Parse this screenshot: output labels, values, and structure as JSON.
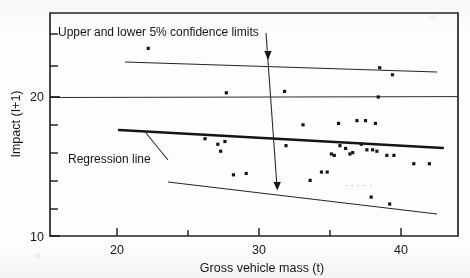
{
  "figure": {
    "background_color": "#fdfdfc",
    "ink_color": "#161616"
  },
  "chart_data": {
    "type": "scatter",
    "title": "",
    "xlabel": "Gross vehicle mass (t)",
    "ylabel": "Impact (I+1)",
    "xlim": [
      15.5,
      45.5
    ],
    "ylim": [
      10,
      25.2
    ],
    "xticks": [
      20,
      25,
      30,
      35,
      40,
      45
    ],
    "xtick_labels": [
      "20",
      "",
      "30",
      "",
      "40",
      ""
    ],
    "xtick_major": [
      20,
      30,
      40
    ],
    "yticks": [
      10,
      11.9,
      13.8,
      15.7,
      17.6,
      20,
      21.5,
      23.4
    ],
    "ytick_labels": [
      "10",
      "",
      "",
      "",
      "",
      "20",
      "",
      ""
    ],
    "ytick_major": [
      10,
      20
    ],
    "grid": false,
    "gridlines_horizontal": [
      20
    ],
    "legend": "none",
    "x": [
      22.2,
      27.7,
      31.8,
      38.5,
      39.4,
      38.4,
      33.1,
      35.6,
      36.9,
      37.5,
      38.2,
      26.2,
      27.1,
      27.6,
      27.3,
      31.9,
      35.7,
      36.1,
      37.2,
      37.6,
      38.0,
      38.3,
      39.0,
      39.5,
      42.0,
      28.2,
      29.1,
      33.6,
      34.4,
      34.8,
      35.1,
      35.3,
      36.4,
      36.6,
      37.9,
      39.2,
      40.9
    ],
    "y": [
      23.5,
      20.3,
      20.4,
      22.1,
      21.6,
      20.0,
      18.0,
      18.1,
      18.3,
      18.3,
      18.1,
      17.0,
      16.6,
      16.8,
      16.1,
      16.5,
      16.5,
      16.3,
      16.6,
      16.2,
      16.2,
      16.1,
      15.8,
      15.8,
      15.2,
      14.4,
      14.5,
      14.0,
      14.6,
      14.6,
      15.9,
      15.8,
      15.9,
      16.0,
      12.8,
      12.3,
      15.2
    ],
    "series": [
      {
        "name": "observations",
        "marker": "square",
        "color": "#161616",
        "points": [
          [
            22.2,
            23.5
          ],
          [
            27.7,
            20.3
          ],
          [
            31.8,
            20.4
          ],
          [
            38.5,
            22.1
          ],
          [
            39.4,
            21.6
          ],
          [
            38.4,
            20.0
          ],
          [
            33.1,
            18.0
          ],
          [
            35.6,
            18.1
          ],
          [
            36.9,
            18.3
          ],
          [
            37.5,
            18.3
          ],
          [
            38.2,
            18.1
          ],
          [
            26.2,
            17.0
          ],
          [
            27.1,
            16.6
          ],
          [
            27.6,
            16.8
          ],
          [
            27.3,
            16.1
          ],
          [
            31.9,
            16.5
          ],
          [
            35.7,
            16.5
          ],
          [
            36.1,
            16.3
          ],
          [
            37.2,
            16.6
          ],
          [
            37.6,
            16.2
          ],
          [
            38.0,
            16.2
          ],
          [
            38.3,
            16.1
          ],
          [
            39.0,
            15.8
          ],
          [
            39.5,
            15.8
          ],
          [
            42.0,
            15.2
          ],
          [
            28.2,
            14.4
          ],
          [
            29.1,
            14.5
          ],
          [
            33.6,
            14.0
          ],
          [
            34.4,
            14.6
          ],
          [
            34.8,
            14.6
          ],
          [
            35.1,
            15.9
          ],
          [
            35.3,
            15.8
          ],
          [
            36.4,
            15.9
          ],
          [
            36.6,
            16.0
          ],
          [
            37.9,
            12.8
          ],
          [
            39.2,
            12.3
          ],
          [
            40.9,
            15.2
          ]
        ]
      }
    ],
    "lines": [
      {
        "name": "regression-line",
        "label": "Regression line",
        "style": "solid-bold",
        "width": 2.2,
        "points": [
          [
            20.8,
            17.7
          ],
          [
            43.5,
            16.4
          ]
        ]
      },
      {
        "name": "upper-confidence-limit",
        "label": "Upper 5% confidence limit",
        "style": "solid-thin",
        "width": 1,
        "points": [
          [
            21.2,
            23.6
          ],
          [
            43.2,
            22.6
          ]
        ]
      },
      {
        "name": "lower-confidence-limit",
        "label": "Lower 5% confidence limit",
        "style": "solid-thin",
        "width": 1,
        "points": [
          [
            24.2,
            14.0
          ],
          [
            43.2,
            11.2
          ]
        ]
      },
      {
        "name": "gridline-at-20",
        "label": "",
        "style": "solid-thin",
        "width": 1,
        "points": [
          [
            15.5,
            20.0
          ],
          [
            45.5,
            20.05
          ]
        ]
      }
    ],
    "annotations": [
      {
        "name": "confidence-limits-annotation",
        "text": "Upper and lower 5% confidence limits",
        "x": 16.8,
        "y": 24.6,
        "arrow": {
          "type": "double-headed-vertical",
          "from": [
            30.0,
            23.25
          ],
          "to": [
            31.1,
            13.25
          ]
        }
      },
      {
        "name": "regression-line-annotation",
        "text": "Regression line",
        "x": 17.6,
        "y": 16.1,
        "arrow": {
          "type": "leader",
          "from": [
            25.0,
            15.7
          ],
          "to": [
            23.5,
            17.45
          ]
        }
      }
    ]
  },
  "axes": {
    "x_title": "Gross vehicle mass (t)",
    "y_title": "Impact (I+1)",
    "x_labels": [
      "20",
      "30",
      "40"
    ],
    "y_labels": [
      "20",
      "10"
    ]
  },
  "annotations": {
    "confidence": "Upper and lower 5% confidence limits",
    "regression": "Regression line"
  }
}
